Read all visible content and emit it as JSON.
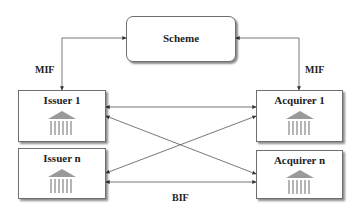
{
  "diagram": {
    "nodes": {
      "scheme": {
        "label": "Scheme"
      },
      "issuer_1": {
        "label": "Issuer 1",
        "icon": "bank-icon"
      },
      "issuer_n": {
        "label": "Issuer n",
        "icon": "bank-icon"
      },
      "acquirer_1": {
        "label": "Acquirer 1",
        "icon": "bank-icon"
      },
      "acquirer_n": {
        "label": "Acquirer n",
        "icon": "bank-icon"
      }
    },
    "edge_labels": {
      "mif_left": "MIF",
      "mif_right": "MIF",
      "bif": "BIF"
    },
    "edges": [
      {
        "from": "scheme",
        "to": "issuer_1",
        "label": "MIF",
        "bidirectional": true
      },
      {
        "from": "scheme",
        "to": "acquirer_1",
        "label": "MIF",
        "bidirectional": true
      },
      {
        "from": "issuer_1",
        "to": "acquirer_1",
        "bidirectional": true
      },
      {
        "from": "issuer_1",
        "to": "acquirer_n",
        "bidirectional": true
      },
      {
        "from": "issuer_n",
        "to": "acquirer_1",
        "bidirectional": true
      },
      {
        "from": "issuer_n",
        "to": "acquirer_n",
        "label": "BIF",
        "bidirectional": true
      }
    ],
    "colors": {
      "line": "#555555",
      "bank_icon": "#9a9a9a",
      "box_border": "#6f6f6f"
    }
  }
}
